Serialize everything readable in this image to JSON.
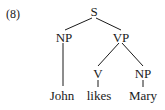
{
  "example_number": "(8)",
  "tree": {
    "root": "S",
    "nodes": {
      "s": "S",
      "np_subject": "NP",
      "vp": "VP",
      "v": "V",
      "np_object": "NP"
    },
    "leaves": {
      "john": "John",
      "likes": "likes",
      "mary": "Mary"
    },
    "structure": "[S [NP John] [VP [V likes] [NP Mary]]]"
  },
  "colors": {
    "ink": "#1a1a1a",
    "background": "#ffffff"
  }
}
